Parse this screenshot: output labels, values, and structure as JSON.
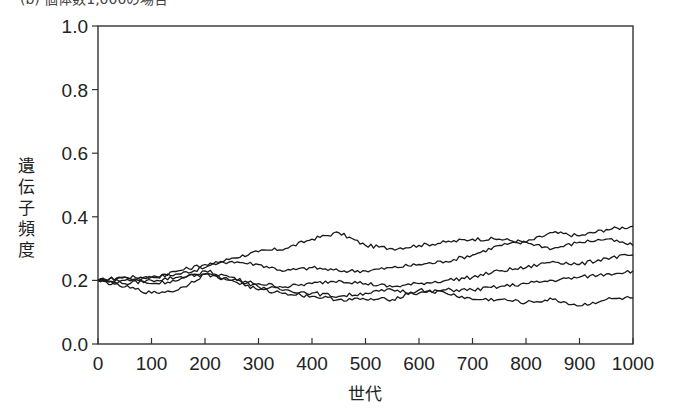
{
  "caption": "(b) 個体数1,000の場合",
  "chart_data": {
    "type": "line",
    "title": "",
    "xlabel": "世代",
    "ylabel": "遺伝子頻度",
    "xlim": [
      0,
      1000
    ],
    "ylim": [
      0.0,
      1.0
    ],
    "xticks": [
      0,
      100,
      200,
      300,
      400,
      500,
      600,
      700,
      800,
      900,
      1000
    ],
    "xtick_labels": [
      "0",
      "100",
      "200",
      "300",
      "400",
      "500",
      "600",
      "700",
      "800",
      "900",
      "1000"
    ],
    "yticks": [
      0.0,
      0.2,
      0.4,
      0.6,
      0.8,
      1.0
    ],
    "ytick_labels": [
      "0.0",
      "0.2",
      "0.4",
      "0.6",
      "0.8",
      "1.0"
    ],
    "grid": false,
    "legend": null,
    "line_color": "#1a1a1a",
    "x": [
      0,
      50,
      100,
      150,
      200,
      250,
      300,
      350,
      400,
      450,
      500,
      550,
      600,
      650,
      700,
      750,
      800,
      850,
      900,
      950,
      1000
    ],
    "series": [
      {
        "name": "run-1",
        "values": [
          0.2,
          0.21,
          0.21,
          0.22,
          0.24,
          0.27,
          0.29,
          0.3,
          0.33,
          0.35,
          0.31,
          0.3,
          0.31,
          0.32,
          0.33,
          0.33,
          0.32,
          0.35,
          0.34,
          0.36,
          0.37
        ]
      },
      {
        "name": "run-2",
        "values": [
          0.2,
          0.2,
          0.21,
          0.23,
          0.25,
          0.26,
          0.25,
          0.23,
          0.24,
          0.23,
          0.23,
          0.24,
          0.25,
          0.26,
          0.28,
          0.31,
          0.32,
          0.3,
          0.32,
          0.33,
          0.31
        ]
      },
      {
        "name": "run-3",
        "values": [
          0.2,
          0.19,
          0.2,
          0.21,
          0.22,
          0.2,
          0.19,
          0.18,
          0.19,
          0.2,
          0.19,
          0.18,
          0.19,
          0.2,
          0.21,
          0.23,
          0.24,
          0.26,
          0.25,
          0.27,
          0.28
        ]
      },
      {
        "name": "run-4",
        "values": [
          0.2,
          0.21,
          0.19,
          0.2,
          0.23,
          0.21,
          0.18,
          0.17,
          0.16,
          0.15,
          0.16,
          0.17,
          0.16,
          0.17,
          0.17,
          0.18,
          0.19,
          0.2,
          0.21,
          0.22,
          0.23
        ]
      },
      {
        "name": "run-5",
        "values": [
          0.2,
          0.18,
          0.16,
          0.17,
          0.22,
          0.2,
          0.17,
          0.16,
          0.15,
          0.14,
          0.14,
          0.14,
          0.17,
          0.16,
          0.14,
          0.14,
          0.13,
          0.14,
          0.12,
          0.14,
          0.145
        ]
      }
    ]
  }
}
